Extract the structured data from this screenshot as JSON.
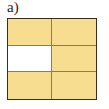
{
  "figure": {
    "panel_label": "a)",
    "type": "grid-diagram",
    "columns": 2,
    "rows": 3,
    "colors": {
      "fill": "#f7dd90",
      "empty": "#ffffff",
      "outer_border": "#3a2b1d",
      "inner_border": "#9a7b3a",
      "background": "#ffffff",
      "label_text": "#231f1c"
    },
    "cells": [
      {
        "row": 1,
        "col": 1,
        "state": "filled",
        "name": "cell-r1c1"
      },
      {
        "row": 1,
        "col": 2,
        "state": "filled",
        "name": "cell-r1c2"
      },
      {
        "row": 2,
        "col": 1,
        "state": "empty",
        "name": "cell-r2c1"
      },
      {
        "row": 2,
        "col": 2,
        "state": "filled",
        "name": "cell-r2c2"
      },
      {
        "row": 3,
        "col": 1,
        "state": "filled",
        "name": "cell-r3c1"
      },
      {
        "row": 3,
        "col": 2,
        "state": "filled",
        "name": "cell-r3c2"
      }
    ],
    "filled_count": 5,
    "empty_count": 1
  }
}
